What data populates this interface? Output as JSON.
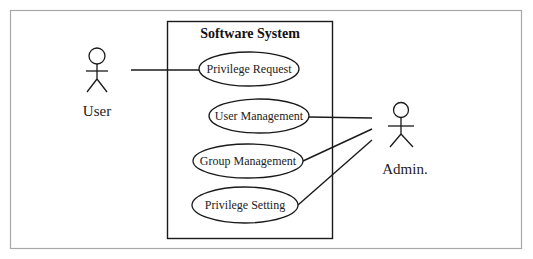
{
  "diagram": {
    "type": "uml-use-case",
    "system": {
      "title": "Software System"
    },
    "actors": [
      {
        "id": "user",
        "label": "User"
      },
      {
        "id": "admin",
        "label": "Admin."
      }
    ],
    "use_cases": [
      {
        "id": "privilege-request",
        "label": "Privilege Request"
      },
      {
        "id": "user-management",
        "label": "User Management"
      },
      {
        "id": "group-management",
        "label": "Group Management"
      },
      {
        "id": "privilege-setting",
        "label": "Privilege Setting"
      }
    ],
    "associations": [
      {
        "from": "user",
        "to": "privilege-request"
      },
      {
        "from": "admin",
        "to": "user-management"
      },
      {
        "from": "admin",
        "to": "group-management"
      },
      {
        "from": "admin",
        "to": "privilege-setting"
      }
    ],
    "colors": {
      "stroke": "#1a1a1a",
      "frame": "#a8a8a8",
      "background": "#ffffff"
    }
  }
}
